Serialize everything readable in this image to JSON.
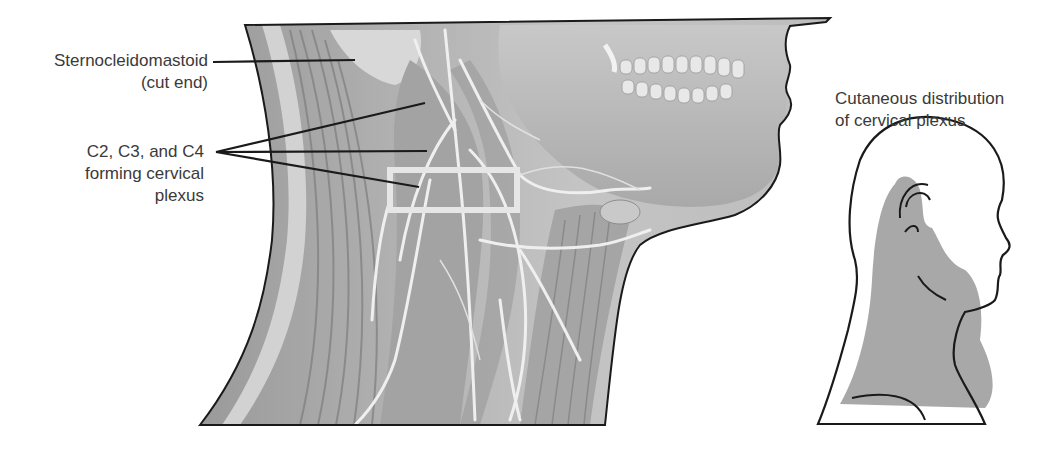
{
  "figure": {
    "labels": {
      "sternocleidomastoid_line1": "Sternocleidomastoid",
      "sternocleidomastoid_line2": "(cut end)",
      "cervical_line1": "C2, C3, and C4",
      "cervical_line2": "forming cervical",
      "cervical_line3": "plexus",
      "cutaneous_line1": "Cutaneous distribution",
      "cutaneous_line2": "of cervical plexus"
    },
    "colors": {
      "outline": "#1a1a1a",
      "tissue_base": "#b8b8b8",
      "tissue_dark": "#8a8a8a",
      "nerve": "#eeeeee",
      "highlight_box": "#e6e6e6",
      "cutaneous_shade": "#a8a8a8"
    }
  }
}
